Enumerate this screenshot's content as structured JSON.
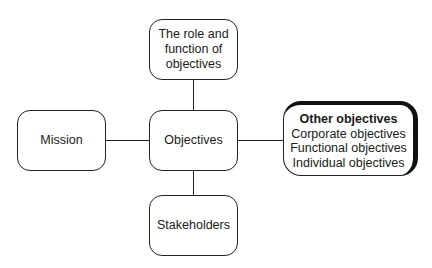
{
  "diagram": {
    "center": {
      "label": "Objectives"
    },
    "top": {
      "lines": [
        "The role and",
        "function of",
        "objectives"
      ]
    },
    "left": {
      "label": "Mission"
    },
    "bottom": {
      "label": "Stakeholders"
    },
    "right": {
      "title": "Other objectives",
      "items": [
        "Corporate objectives",
        "Functional objectives",
        "Individual objectives"
      ]
    },
    "connections": [
      [
        "The role and function of objectives",
        "Objectives"
      ],
      [
        "Mission",
        "Objectives"
      ],
      [
        "Objectives",
        "Other objectives"
      ],
      [
        "Objectives",
        "Stakeholders"
      ]
    ],
    "colors": {
      "stroke": "#222222",
      "shadow": "#111111",
      "background": "#ffffff"
    }
  }
}
